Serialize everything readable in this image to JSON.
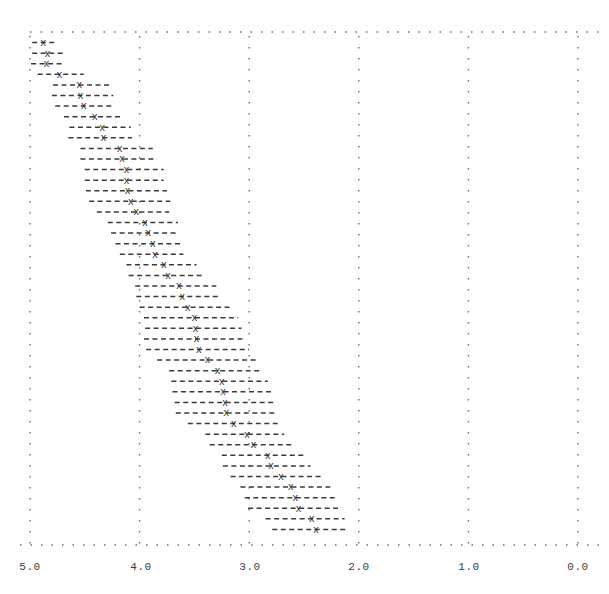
{
  "chart_data": {
    "type": "scatter",
    "title": "",
    "subtitle": "",
    "xlabel": "",
    "ylabel": "",
    "xlim": [
      5.0,
      0.0
    ],
    "x_axis_reversed": true,
    "grid": true,
    "grid_style": "dotted",
    "legend": null,
    "marker": "x",
    "errorbar_style": "dashed-horizontal",
    "xticks": [
      5.0,
      4.0,
      3.0,
      2.0,
      1.0,
      0.0
    ],
    "xtick_labels": [
      "5.0",
      "4.0",
      "3.0",
      "2.0",
      "1.0",
      "0.0"
    ],
    "yticks": [],
    "ytick_labels": [],
    "n_points": 47,
    "x": [
      4.88,
      4.84,
      4.85,
      4.73,
      4.55,
      4.54,
      4.51,
      4.41,
      4.34,
      4.33,
      4.18,
      4.16,
      4.12,
      4.12,
      4.11,
      4.08,
      4.03,
      3.95,
      3.92,
      3.88,
      3.86,
      3.78,
      3.74,
      3.64,
      3.61,
      3.56,
      3.5,
      3.49,
      3.48,
      3.46,
      3.38,
      3.29,
      3.25,
      3.24,
      3.22,
      3.21,
      3.14,
      3.02,
      2.96,
      2.83,
      2.8,
      2.71,
      2.62,
      2.58,
      2.55,
      2.43,
      2.39
    ],
    "xerr_low": [
      0.1,
      0.14,
      0.16,
      0.22,
      0.28,
      0.3,
      0.28,
      0.26,
      0.26,
      0.26,
      0.3,
      0.32,
      0.34,
      0.34,
      0.36,
      0.36,
      0.3,
      0.3,
      0.28,
      0.28,
      0.26,
      0.3,
      0.32,
      0.34,
      0.34,
      0.38,
      0.4,
      0.42,
      0.44,
      0.46,
      0.44,
      0.4,
      0.42,
      0.44,
      0.44,
      0.44,
      0.4,
      0.34,
      0.36,
      0.34,
      0.36,
      0.38,
      0.36,
      0.36,
      0.36,
      0.3,
      0.28
    ],
    "xerr_high": [
      0.1,
      0.14,
      0.14,
      0.2,
      0.24,
      0.26,
      0.26,
      0.28,
      0.3,
      0.32,
      0.36,
      0.38,
      0.38,
      0.38,
      0.38,
      0.38,
      0.36,
      0.34,
      0.34,
      0.34,
      0.32,
      0.34,
      0.36,
      0.4,
      0.42,
      0.44,
      0.46,
      0.46,
      0.48,
      0.48,
      0.46,
      0.44,
      0.46,
      0.46,
      0.46,
      0.46,
      0.42,
      0.38,
      0.4,
      0.42,
      0.44,
      0.46,
      0.46,
      0.46,
      0.46,
      0.42,
      0.4
    ],
    "colors": {
      "marker": "#2b2b2b",
      "errorbar": "#3a3a3a",
      "grid": "#6b6b6b",
      "axis_label": "#3b3b3b",
      "background": "#ffffff"
    }
  },
  "axis": {
    "tick_0": "5.0",
    "tick_1": "4.0",
    "tick_2": "3.0",
    "tick_3": "2.0",
    "tick_4": "1.0",
    "tick_5": "0.0"
  }
}
